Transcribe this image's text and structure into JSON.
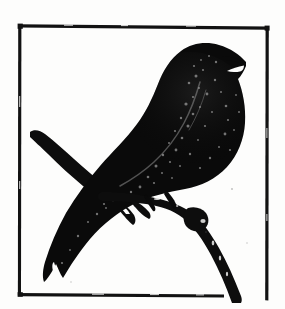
{
  "document": {
    "kind": "illustration",
    "medium": "woodcut-silhouette",
    "title": "Perched Songbird Silhouette",
    "alt_text": "Black silhouette of a perched songbird with open beak on a branch inside a square ink border",
    "background_color": "#fdfdfc",
    "ink_color": "#0d0d0d",
    "canvas": {
      "width": 285,
      "height": 309
    }
  },
  "frame": {
    "name": "square ink border",
    "stroke_color": "#121212",
    "stroke_width": 3,
    "left": 19.5,
    "top": 25.5,
    "right": 267.5,
    "bottom": 295.0,
    "right_edge_bottom": 300.0,
    "bottom_edge_right": 224.0,
    "closed": false,
    "note": "hand-inked, slightly irregular; bottom-right corner left open where branch crosses"
  },
  "subject": {
    "name": "songbird",
    "pose": "perched, body angled up-right, head turned right",
    "beak": {
      "state": "open",
      "tip_x": 245,
      "tip_y": 62
    },
    "head_center": {
      "x": 208,
      "y": 72
    },
    "body_center": {
      "x": 160,
      "y": 135
    },
    "tail_tip": {
      "x": 48,
      "y": 284
    },
    "fill_color": "#0a0a0a"
  },
  "branch": {
    "name": "perch branch",
    "stroke_color": "#0d0d0d",
    "main_start": {
      "x": 108,
      "y": 196
    },
    "main_peak": {
      "x": 178,
      "y": 203
    },
    "main_end": {
      "x": 240,
      "y": 300
    },
    "knob": {
      "x": 196,
      "y": 220
    },
    "stub_start": {
      "x": 30,
      "y": 133
    },
    "stub_end": {
      "x": 120,
      "y": 202
    },
    "stub_hole": {
      "x": 39,
      "y": 150,
      "r": 2.4
    }
  },
  "texture": {
    "highlight_color": "#8e8e8e",
    "speckle_count": 54,
    "note": "scattered white chatter marks across breast and wing, typical of relief print"
  }
}
